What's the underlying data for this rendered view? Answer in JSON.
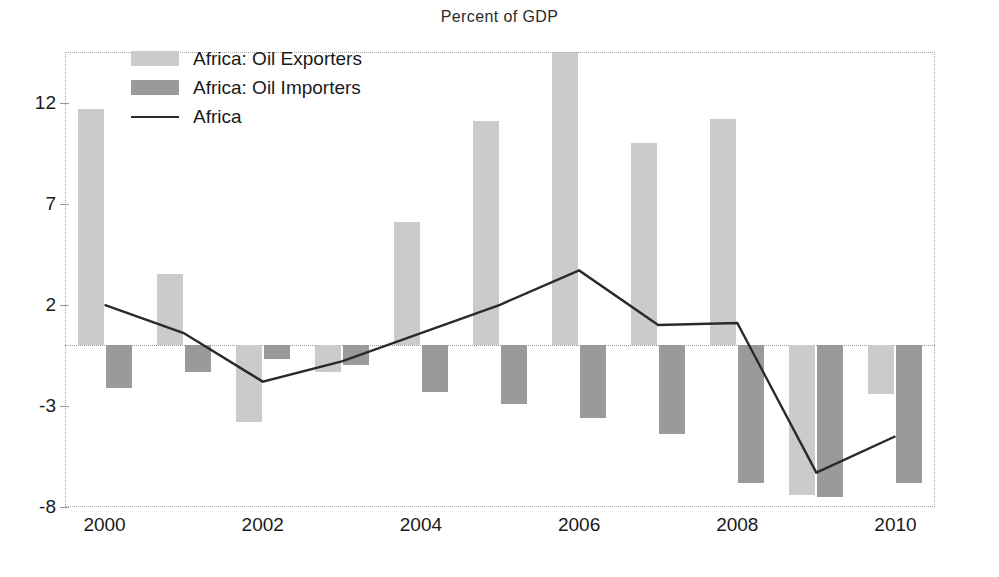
{
  "chart_data": {
    "type": "bar",
    "title": "Percent of GDP",
    "xlabel": "",
    "ylabel": "",
    "categories": [
      "2000",
      "2001",
      "2002",
      "2003",
      "2004",
      "2005",
      "2006",
      "2007",
      "2008",
      "2009",
      "2010"
    ],
    "xtick_labels": [
      "2000",
      "2002",
      "2004",
      "2006",
      "2008",
      "2010"
    ],
    "ytick_labels": [
      "12",
      "7",
      "2",
      "-3",
      "-8"
    ],
    "ytick_values": [
      12,
      7,
      2,
      -3,
      -8
    ],
    "ylim": [
      -8,
      14.5
    ],
    "grid": false,
    "zero_line": true,
    "legend_position": "upper-left-inside",
    "series": [
      {
        "name": "Africa: Oil Exporters",
        "kind": "bar",
        "color": "#cbcbcb",
        "values": [
          11.7,
          3.5,
          -3.8,
          -1.3,
          6.1,
          11.1,
          15.2,
          10.0,
          11.2,
          -7.4,
          -2.4
        ]
      },
      {
        "name": "Africa: Oil Importers",
        "kind": "bar",
        "color": "#9a9a9a",
        "values": [
          -2.1,
          -1.3,
          -0.7,
          -1.0,
          -2.3,
          -2.9,
          -3.6,
          -4.4,
          -6.8,
          -7.5,
          -6.8
        ]
      },
      {
        "name": "Africa",
        "kind": "line",
        "color": "#2a2a2a",
        "values": [
          2.0,
          0.6,
          -1.8,
          -0.8,
          0.6,
          2.0,
          3.7,
          1.0,
          1.1,
          -6.3,
          -4.5
        ]
      }
    ]
  },
  "legend": {
    "items": [
      {
        "label": "Africa: Oil Exporters",
        "marker": "swatch-light"
      },
      {
        "label": "Africa: Oil Importers",
        "marker": "swatch-dark"
      },
      {
        "label": "Africa",
        "marker": "line"
      }
    ]
  }
}
